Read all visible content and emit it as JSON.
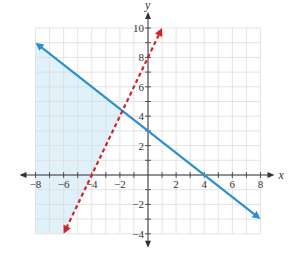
{
  "chart_data": {
    "type": "line",
    "title": "",
    "xlabel": "x",
    "ylabel": "y",
    "xlim": [
      -8,
      8
    ],
    "ylim": [
      -4,
      10
    ],
    "grid": true,
    "x_ticks": [
      -8,
      -6,
      -4,
      -2,
      2,
      4,
      6,
      8
    ],
    "y_ticks": [
      -4,
      -2,
      2,
      4,
      6,
      8,
      10
    ],
    "x_tick_labels": [
      "−8",
      "−6",
      "−4",
      "−2",
      "2",
      "4",
      "6",
      "8"
    ],
    "y_tick_labels": [
      "−4",
      "−2",
      "2",
      "4",
      "6",
      "8",
      "10"
    ],
    "series": [
      {
        "name": "y = -3/4 x + 3",
        "style": "solid",
        "color": "#2b8fd0",
        "x": [
          -8,
          8
        ],
        "y": [
          9,
          -3
        ],
        "arrows": "both"
      },
      {
        "name": "y = 2x + 8",
        "style": "dashed",
        "color": "#d2232a",
        "x": [
          -6,
          1
        ],
        "y": [
          -4,
          10
        ],
        "arrows": "both"
      }
    ],
    "shaded_region": {
      "description": "y < -3/4 x + 3 and y > 2x + 8",
      "color": "#dceef9",
      "vertices": [
        [
          -8,
          9
        ],
        [
          -1.8182,
          4.3636
        ],
        [
          -6,
          -4
        ],
        [
          -8,
          -4
        ]
      ]
    }
  },
  "labels": {
    "x_axis": "x",
    "y_axis": "y"
  }
}
